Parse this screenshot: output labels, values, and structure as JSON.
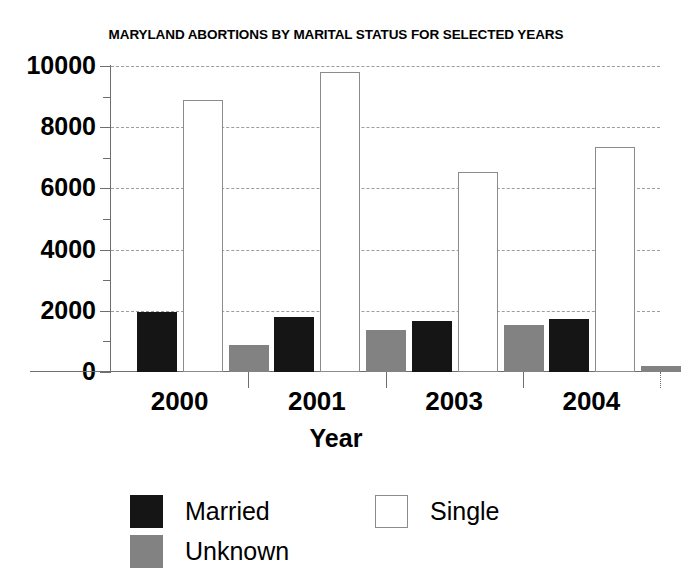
{
  "chart_data": {
    "type": "bar",
    "title": "MARYLAND ABORTIONS BY MARITAL STATUS FOR SELECTED YEARS",
    "xlabel": "Year",
    "ylabel": "",
    "categories": [
      "2000",
      "2001",
      "2003",
      "2004"
    ],
    "series": [
      {
        "name": "Married",
        "color": "#151515",
        "values": [
          1950,
          1810,
          1670,
          1730
        ]
      },
      {
        "name": "Single",
        "color": "#ffffff",
        "values": [
          8880,
          9790,
          6540,
          7350
        ]
      },
      {
        "name": "Unknown",
        "color": "#828282",
        "values": [
          870,
          1370,
          1550,
          210
        ]
      }
    ],
    "ylim": [
      0,
      10000
    ],
    "ytick_labels": [
      "10000",
      "8000",
      "6000",
      "4000",
      "2000",
      "0"
    ],
    "ytick_values": [
      10000,
      8000,
      6000,
      4000,
      2000,
      0
    ],
    "yminor_values": [
      9000,
      7000,
      5000,
      3000,
      1000
    ],
    "grid": true,
    "grid_style": "dashed-horizontal",
    "legend_position": "bottom"
  },
  "legend": {
    "items": [
      {
        "label": "Married",
        "swatch": "married"
      },
      {
        "label": "Single",
        "swatch": "single"
      },
      {
        "label": "Unknown",
        "swatch": "unknown"
      }
    ]
  }
}
